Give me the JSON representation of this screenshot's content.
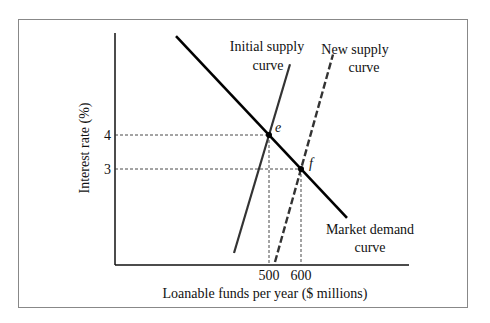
{
  "chart_data": {
    "type": "line",
    "title": "",
    "xlabel": "Loanable funds per year ($ millions)",
    "ylabel": "Interest rate (%)",
    "x_ticks": [
      {
        "value": 500,
        "label": "500"
      },
      {
        "value": 600,
        "label": "600"
      }
    ],
    "y_ticks": [
      {
        "value": 4,
        "label": "4"
      },
      {
        "value": 3,
        "label": "3"
      }
    ],
    "series": [
      {
        "name": "Market demand curve",
        "label_lines": [
          "Market demand",
          "curve"
        ],
        "style": "solid-thick",
        "color": "#000000",
        "direction": "downward-sloping",
        "through": [
          [
            500,
            4
          ],
          [
            600,
            3
          ]
        ]
      },
      {
        "name": "Initial supply curve",
        "label_lines": [
          "Initial supply",
          "curve"
        ],
        "style": "solid",
        "color": "#333333",
        "direction": "upward-sloping",
        "through": [
          [
            500,
            4
          ]
        ]
      },
      {
        "name": "New supply curve",
        "label_lines": [
          "New supply",
          "curve"
        ],
        "style": "dashed",
        "color": "#333333",
        "direction": "upward-sloping",
        "through": [
          [
            600,
            3
          ]
        ]
      }
    ],
    "points": [
      {
        "label": "e",
        "x": 500,
        "y": 4
      },
      {
        "label": "f",
        "x": 600,
        "y": 3
      }
    ],
    "grid": false,
    "legend": "none"
  }
}
